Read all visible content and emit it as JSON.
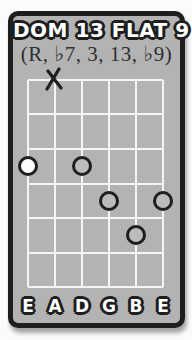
{
  "page": {
    "background": "#fbfbfb"
  },
  "card": {
    "title": "DOM 13 FLAT 9",
    "formula": "(R, ♭7, 3, 13, ♭9)",
    "colors": {
      "page_bg": "#fbfbfb",
      "card_bg": "#b3b3b3",
      "ink": "#1e1e1e",
      "grid_line": "#f4f4f4",
      "root_fill": "#ffffff",
      "note_fill": "#bcbcbc"
    }
  },
  "fretboard": {
    "num_strings": 6,
    "num_frets": 6,
    "string_labels": [
      "E",
      "A",
      "D",
      "G",
      "B",
      "E"
    ],
    "muted_string_indexes": [
      1
    ],
    "markers": [
      {
        "string_index": 0,
        "fret": 3,
        "type": "root"
      },
      {
        "string_index": 2,
        "fret": 3,
        "type": "note"
      },
      {
        "string_index": 3,
        "fret": 4,
        "type": "note"
      },
      {
        "string_index": 4,
        "fret": 5,
        "type": "note"
      },
      {
        "string_index": 5,
        "fret": 4,
        "type": "note"
      }
    ]
  }
}
